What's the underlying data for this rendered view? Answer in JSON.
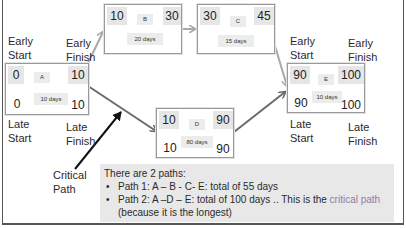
{
  "diagram": {
    "type": "network-diagram-critical-path",
    "nodes": {
      "A": {
        "id": "A",
        "es": "0",
        "ef": "10",
        "ls": "0",
        "lf": "10",
        "duration": "10 days"
      },
      "B": {
        "id": "B",
        "es": "10",
        "ef": "30",
        "duration": "20 days"
      },
      "C": {
        "id": "C",
        "es": "30",
        "ef": "45",
        "duration": "15 days"
      },
      "D": {
        "id": "D",
        "es": "10",
        "ef": "90",
        "ls": "10",
        "lf": "90",
        "duration": "80 days"
      },
      "E": {
        "id": "E",
        "es": "90",
        "ef": "100",
        "ls": "90",
        "lf": "100",
        "duration": "10 days"
      }
    },
    "edges": [
      {
        "from": "A",
        "to": "B"
      },
      {
        "from": "B",
        "to": "C"
      },
      {
        "from": "C",
        "to": "E"
      },
      {
        "from": "A",
        "to": "D"
      },
      {
        "from": "D",
        "to": "E"
      }
    ],
    "labels": {
      "left": {
        "early_start": [
          "Early",
          "Start"
        ],
        "early_finish": [
          "Early",
          "Finish"
        ],
        "late_start": [
          "Late",
          "Start"
        ],
        "late_finish": [
          "Late",
          "Finish"
        ]
      },
      "right": {
        "early_start": [
          "Early",
          "Start"
        ],
        "early_finish": [
          "Early",
          "Finish"
        ],
        "late_start": [
          "Late",
          "Start"
        ],
        "late_finish": [
          "Late",
          "Finish"
        ]
      },
      "critical_path_callout": [
        "Critical",
        "Path"
      ]
    },
    "note": {
      "heading": "There are 2 paths:",
      "path1": "Path 1: A – B - C- E: total of 55 days",
      "path2_prefix": "Path 2: A –D – E: total of 100 days .. This is the ",
      "path2_highlight": "critical path",
      "path2_suffix": "(because it is the longest)"
    },
    "colors": {
      "node_border": "#9a9a9a",
      "cell_shade": "#e6e6e6",
      "note_bg": "#e8e8e8",
      "arrow_light": "#a8a8a8",
      "arrow_dark": "#6a6a6a",
      "callout_arrow": "#111111",
      "critical_text": "#8a7ea8"
    }
  }
}
